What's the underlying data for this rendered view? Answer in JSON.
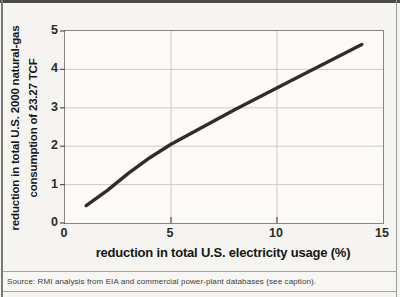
{
  "chart_data": {
    "type": "line",
    "title": "",
    "xlabel": "reduction in total U.S. electricity usage (%)",
    "ylabel": "reduction in total U.S. 2000 natural-gas consumption of 23.27 TCF",
    "ylabel_line1": "reduction in total U.S. 2000 natural-gas",
    "ylabel_line2": "consumption of 23.27 TCF",
    "xlim": [
      0,
      15
    ],
    "ylim": [
      0,
      5
    ],
    "x_ticks": [
      0,
      5,
      10,
      15
    ],
    "y_ticks": [
      0,
      1,
      2,
      3,
      4,
      5
    ],
    "grid_x": [
      5,
      10
    ],
    "grid_y": [
      1,
      2,
      3,
      4
    ],
    "grid_on": true,
    "legend_position": "none",
    "series": [
      {
        "name": "natural-gas consumption reduction (TCF)",
        "x": [
          1,
          2,
          3,
          4,
          5,
          8,
          11,
          14
        ],
        "y": [
          0.45,
          0.85,
          1.3,
          1.7,
          2.05,
          2.95,
          3.8,
          4.65
        ],
        "color": "#2e2d2b",
        "stroke_width": 3.4
      }
    ]
  },
  "colors": {
    "paper": "#f5f4f1",
    "plot_background": "#fcfbf8",
    "frame": "#85847f",
    "grid": "#cac9c4",
    "tick_mark": "#55534e",
    "top_rule": "#4b4a45"
  },
  "source": {
    "text": "Source: RMI analysis from EIA and commercial power-plant databases (see caption)."
  }
}
